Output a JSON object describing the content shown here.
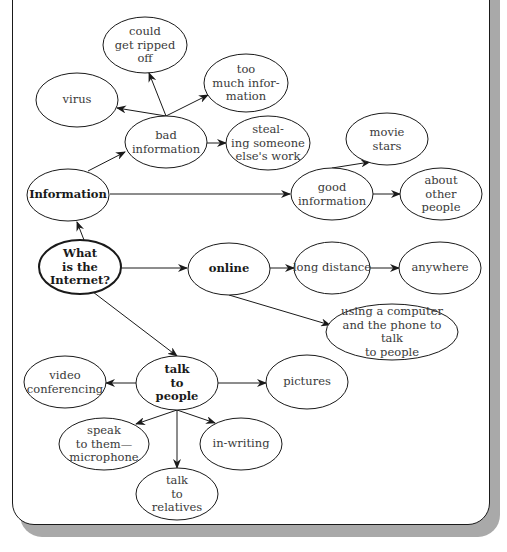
{
  "diagram": {
    "type": "concept-map",
    "colors": {
      "stroke": "#1a1a1a",
      "text": "#3a3a3a",
      "shadow": "#a9a9a9",
      "background": "#ffffff"
    },
    "nodes": [
      {
        "id": "what",
        "label": "What\nis the\nInternet?",
        "bold": true,
        "central": true,
        "cx": 80,
        "cy": 267,
        "rx": 41,
        "ry": 27
      },
      {
        "id": "information",
        "label": "Information",
        "bold": true,
        "cx": 68,
        "cy": 195,
        "rx": 41,
        "ry": 26
      },
      {
        "id": "bad",
        "label": "bad\ninformation",
        "cx": 166,
        "cy": 142,
        "rx": 41,
        "ry": 26
      },
      {
        "id": "virus",
        "label": "virus",
        "cx": 77,
        "cy": 100,
        "rx": 41,
        "ry": 27
      },
      {
        "id": "ripped",
        "label": "could\nget ripped\noff",
        "cx": 145,
        "cy": 45,
        "rx": 42,
        "ry": 28
      },
      {
        "id": "toomuch",
        "label": "too\nmuch infor-\nmation",
        "cx": 246,
        "cy": 83,
        "rx": 42,
        "ry": 29
      },
      {
        "id": "stealing",
        "label": "steal-\ning someone\nelse's work",
        "cx": 268,
        "cy": 143,
        "rx": 42,
        "ry": 27
      },
      {
        "id": "good",
        "label": "good\ninformation",
        "cx": 332,
        "cy": 194,
        "rx": 41,
        "ry": 26
      },
      {
        "id": "movie",
        "label": "movie\nstars",
        "cx": 387,
        "cy": 139,
        "rx": 41,
        "ry": 26
      },
      {
        "id": "about",
        "label": "about\nother\npeople",
        "cx": 441,
        "cy": 194,
        "rx": 41,
        "ry": 26
      },
      {
        "id": "online",
        "label": "online",
        "bold": true,
        "cx": 229,
        "cy": 269,
        "rx": 41,
        "ry": 26
      },
      {
        "id": "longdist",
        "label": "long distance",
        "cx": 332,
        "cy": 268,
        "rx": 38,
        "ry": 26
      },
      {
        "id": "anywhere",
        "label": "anywhere",
        "cx": 440,
        "cy": 268,
        "rx": 41,
        "ry": 26
      },
      {
        "id": "computer",
        "label": "using a computer\nand the phone to talk\nto people",
        "cx": 392,
        "cy": 332,
        "rx": 66,
        "ry": 28
      },
      {
        "id": "talk",
        "label": "talk\nto\npeople",
        "bold": true,
        "cx": 177,
        "cy": 383,
        "rx": 41,
        "ry": 27
      },
      {
        "id": "video",
        "label": "video\nconferencing",
        "cx": 65,
        "cy": 382,
        "rx": 41,
        "ry": 26
      },
      {
        "id": "pictures",
        "label": "pictures",
        "cx": 307,
        "cy": 382,
        "rx": 41,
        "ry": 27
      },
      {
        "id": "speak",
        "label": "speak\nto them—\nmicrophone",
        "cx": 104,
        "cy": 444,
        "rx": 45,
        "ry": 26
      },
      {
        "id": "writing",
        "label": "in-writing",
        "cx": 241,
        "cy": 444,
        "rx": 41,
        "ry": 26
      },
      {
        "id": "relatives",
        "label": "talk\nto\nrelatives",
        "cx": 177,
        "cy": 494,
        "rx": 41,
        "ry": 26
      }
    ],
    "edges": [
      {
        "from": "what",
        "to": "information",
        "x1": 84,
        "y1": 240,
        "x2": 77,
        "y2": 222
      },
      {
        "from": "information",
        "to": "bad",
        "x1": 88,
        "y1": 171,
        "x2": 125,
        "y2": 152
      },
      {
        "from": "bad",
        "to": "virus",
        "x1": 166,
        "y1": 116,
        "x2": 117,
        "y2": 108
      },
      {
        "from": "bad",
        "to": "ripped",
        "x1": 166,
        "y1": 116,
        "x2": 149,
        "y2": 73
      },
      {
        "from": "bad",
        "to": "toomuch",
        "x1": 166,
        "y1": 116,
        "x2": 208,
        "y2": 95
      },
      {
        "from": "bad",
        "to": "stealing",
        "x1": 207,
        "y1": 143,
        "x2": 226,
        "y2": 143
      },
      {
        "from": "information",
        "to": "good",
        "x1": 110,
        "y1": 194,
        "x2": 290,
        "y2": 194
      },
      {
        "from": "good",
        "to": "movie",
        "x1": 332,
        "y1": 168,
        "x2": 370,
        "y2": 162
      },
      {
        "from": "good",
        "to": "about",
        "x1": 373,
        "y1": 194,
        "x2": 400,
        "y2": 194
      },
      {
        "from": "what",
        "to": "online",
        "x1": 121,
        "y1": 268,
        "x2": 187,
        "y2": 268
      },
      {
        "from": "online",
        "to": "longdist",
        "x1": 270,
        "y1": 268,
        "x2": 294,
        "y2": 268
      },
      {
        "from": "longdist",
        "to": "anywhere",
        "x1": 370,
        "y1": 268,
        "x2": 399,
        "y2": 268
      },
      {
        "from": "online",
        "to": "computer",
        "x1": 229,
        "y1": 295,
        "x2": 330,
        "y2": 325
      },
      {
        "from": "what",
        "to": "talk",
        "x1": 93,
        "y1": 292,
        "x2": 177,
        "y2": 356
      },
      {
        "from": "talk",
        "to": "video",
        "x1": 136,
        "y1": 383,
        "x2": 106,
        "y2": 383
      },
      {
        "from": "talk",
        "to": "pictures",
        "x1": 218,
        "y1": 383,
        "x2": 266,
        "y2": 383
      },
      {
        "from": "talk",
        "to": "speak",
        "x1": 177,
        "y1": 410,
        "x2": 136,
        "y2": 424
      },
      {
        "from": "talk",
        "to": "writing",
        "x1": 177,
        "y1": 410,
        "x2": 215,
        "y2": 423
      },
      {
        "from": "talk",
        "to": "relatives",
        "x1": 177,
        "y1": 410,
        "x2": 177,
        "y2": 468
      }
    ]
  }
}
